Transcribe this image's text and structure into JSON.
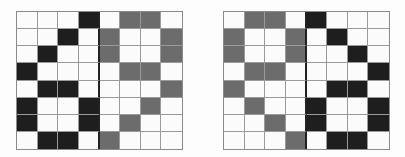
{
  "figure": {
    "colors": {
      "black": "#1e1e1e",
      "gray": "#6c6c6c",
      "white": "#fbfbfb",
      "gridline": "#9a9a9a"
    },
    "grids": [
      {
        "name": "left",
        "rows": [
          "...B.GG.",
          "..B.G..G",
          ".B..G..G",
          "B....GG.",
          ".BB....G",
          "B..B..G.",
          "B..B.G..",
          ".BB.G..."
        ]
      },
      {
        "name": "right",
        "rows": [
          ".GG.B...",
          "G..G.B..",
          "G..G..B.",
          ".GG....B",
          "G....BB.",
          ".G..B..B",
          "..G.B..B",
          "...G.BB."
        ]
      }
    ]
  }
}
